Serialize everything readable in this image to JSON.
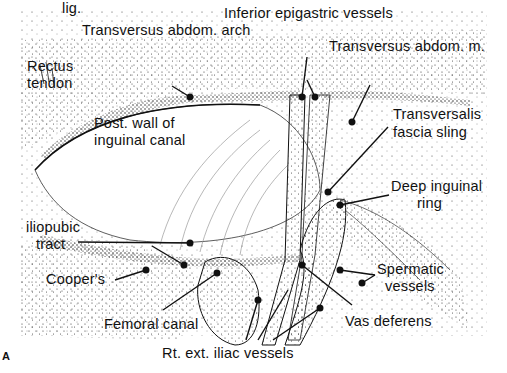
{
  "figure": {
    "panel_letter": "A",
    "colors": {
      "ink": "#111111",
      "background": "#ffffff",
      "stipple": "#222222"
    },
    "labels": {
      "inferior_epigastric": "Inferior epigastric vessels",
      "transversus_arch": "Transversus abdom. arch",
      "transversus_muscle": "Transversus abdom. m.",
      "rectus_tendon_1": "Rectus",
      "rectus_tendon_2": "tendon",
      "post_wall_1": "Post. wall of",
      "post_wall_2": "inguinal canal",
      "transversalis_1": "Transversalis",
      "transversalis_2": "fascia sling",
      "deep_ring_1": "Deep inguinal",
      "deep_ring_2": "ring",
      "iliopubic_1": "iliopubic",
      "iliopubic_2": "tract",
      "coopers_1": "Cooper's",
      "coopers_2": "lig.",
      "spermatic_1": "Spermatic",
      "spermatic_2": "vessels",
      "femoral_canal": "Femoral canal",
      "vas_deferens": "Vas deferens",
      "ext_iliac": "Rt. ext. iliac vessels"
    }
  }
}
